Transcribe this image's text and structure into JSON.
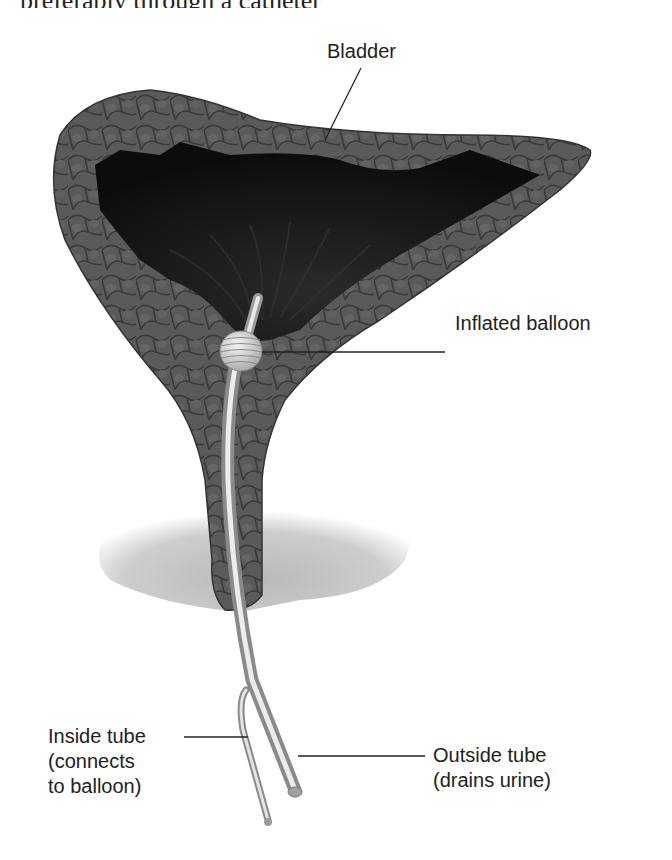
{
  "header": {
    "partial_text": "preferably through a catheter"
  },
  "labels": {
    "bladder": "Bladder",
    "inflated_balloon": "Inflated balloon",
    "inside_tube": [
      "Inside tube",
      "(connects",
      "to balloon)"
    ],
    "outside_tube": [
      "Outside tube",
      "(drains urine)"
    ]
  },
  "colors": {
    "bladder_wall": "#555555",
    "bladder_cavity": "#111111",
    "tube": "#c8c8c8",
    "balloon": "#d6d6d6",
    "pelvic_floor": "#bdbdbd",
    "text": "#222222"
  }
}
